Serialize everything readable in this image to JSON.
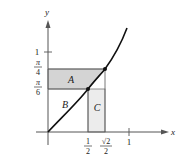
{
  "figure": {
    "axes": {
      "x_label": "x",
      "y_label": "y",
      "origin_px": [
        48,
        132
      ]
    },
    "y_ticks": [
      {
        "label": "1",
        "y": 52
      },
      {
        "label_num": "π",
        "label_den": "4",
        "y": 69
      },
      {
        "label_num": "π",
        "label_den": "6",
        "y": 89
      }
    ],
    "x_ticks": [
      {
        "label_num": "1",
        "label_den": "2",
        "x": 88
      },
      {
        "label_num": "√2",
        "label_den": "2",
        "x": 105
      },
      {
        "label": "1",
        "x": 129
      }
    ],
    "regions": {
      "A": "A",
      "B": "B",
      "C": "C"
    },
    "colors": {
      "region_A": "#d4d4d4",
      "region_C": "#ececec",
      "curve": "#111111",
      "axis": "#555555"
    },
    "points": [
      {
        "name": "(1/2, π/6)",
        "x": 88,
        "y": 89
      },
      {
        "name": "(√2/2, π/4)",
        "x": 105,
        "y": 69
      }
    ]
  }
}
